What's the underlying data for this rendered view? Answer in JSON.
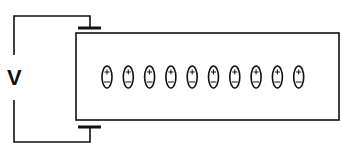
{
  "diagram": {
    "title": "",
    "voltage_label": "V",
    "particle_count": 10,
    "particle_sign_top": "+",
    "particle_sign_bottom": "-",
    "colors": {
      "line": "#111111",
      "background": "#ffffff"
    }
  }
}
